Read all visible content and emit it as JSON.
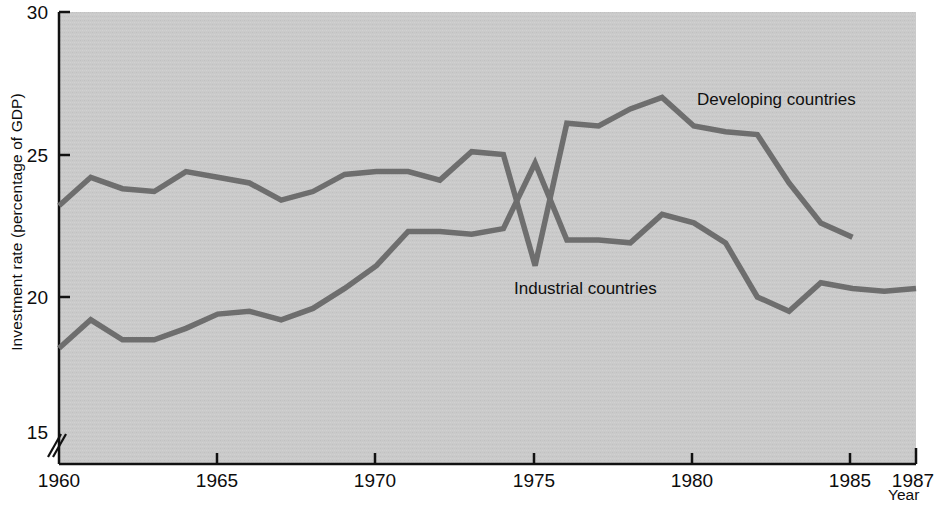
{
  "chart_data": {
    "type": "line",
    "title": "",
    "xlabel": "Year",
    "ylabel": "Investment rate (percentage of GDP)",
    "xlim": [
      1960,
      1987
    ],
    "ylim": [
      15,
      30
    ],
    "y_axis_break": true,
    "y_axis_break_note": "axis broken between 0 and 15",
    "grid": false,
    "legend_position": "inline-labels",
    "plot_background": "#c9c9c9",
    "line_color": "#6b6b6b",
    "xticks": [
      1960,
      1965,
      1970,
      1975,
      1980,
      1985,
      1987
    ],
    "xtick_labels": [
      "1960",
      "1965",
      "1970",
      "1975",
      "1980",
      "1985",
      "1987"
    ],
    "yticks": [
      15,
      20,
      25,
      30
    ],
    "ytick_labels": [
      "15",
      "20",
      "25",
      "30"
    ],
    "x": [
      1960,
      1961,
      1962,
      1963,
      1964,
      1965,
      1966,
      1967,
      1968,
      1969,
      1970,
      1971,
      1972,
      1973,
      1974,
      1975,
      1976,
      1977,
      1978,
      1979,
      1980,
      1981,
      1982,
      1983,
      1984,
      1985,
      1986,
      1987
    ],
    "series": [
      {
        "name": "Developing countries",
        "x": [
          1960,
          1961,
          1962,
          1963,
          1964,
          1965,
          1966,
          1967,
          1968,
          1969,
          1970,
          1971,
          1972,
          1973,
          1974,
          1975,
          1976,
          1977,
          1978,
          1979,
          1980,
          1981,
          1982,
          1983,
          1984,
          1985
        ],
        "values": [
          23.2,
          24.2,
          23.8,
          23.7,
          24.4,
          24.2,
          24.0,
          23.4,
          23.7,
          24.3,
          24.4,
          24.4,
          24.1,
          25.1,
          25.0,
          21.1,
          26.1,
          26.0,
          26.6,
          27.0,
          26.0,
          25.8,
          25.7,
          24.0,
          22.6,
          22.1
        ]
      },
      {
        "name": "Industrial countries",
        "x": [
          1960,
          1961,
          1962,
          1963,
          1964,
          1965,
          1966,
          1967,
          1968,
          1969,
          1970,
          1971,
          1972,
          1973,
          1974,
          1975,
          1976,
          1977,
          1978,
          1979,
          1980,
          1981,
          1982,
          1983,
          1984,
          1985,
          1986,
          1987
        ],
        "values": [
          18.2,
          19.2,
          18.5,
          18.5,
          18.9,
          19.4,
          19.5,
          19.2,
          19.6,
          20.3,
          21.1,
          22.3,
          22.3,
          22.2,
          22.4,
          24.7,
          22.0,
          22.0,
          21.9,
          22.9,
          22.6,
          21.9,
          20.0,
          19.5,
          20.5,
          20.3,
          20.2,
          20.3
        ]
      }
    ],
    "annotations": [
      {
        "text": "Developing countries",
        "x": 1987,
        "y": 27.2
      },
      {
        "text": "Industrial countries",
        "x": 1975,
        "y": 20.5
      }
    ]
  }
}
